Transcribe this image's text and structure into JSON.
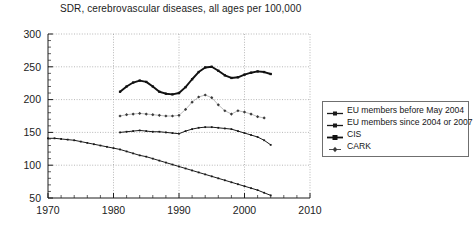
{
  "chart_data": {
    "type": "line",
    "title": "SDR, cerebrovascular diseases, all ages per 100,000",
    "xlabel": "",
    "ylabel": "",
    "xlim": [
      1970,
      2010
    ],
    "ylim": [
      50,
      300
    ],
    "xticks": [
      1970,
      1980,
      1990,
      2000,
      2010
    ],
    "yticks": [
      50,
      100,
      150,
      200,
      250,
      300
    ],
    "xminor_step": 2,
    "yminor_step": 10,
    "grid": true,
    "grid_style": "dotted",
    "legend_position": "right",
    "series": [
      {
        "name": "EU members before May 2004",
        "marker": "square",
        "color": "#1a1a1a",
        "x": [
          1970,
          1971,
          1972,
          1973,
          1974,
          1975,
          1976,
          1977,
          1978,
          1979,
          1980,
          1981,
          1982,
          1983,
          1984,
          1985,
          1986,
          1987,
          1988,
          1989,
          1990,
          1991,
          1992,
          1993,
          1994,
          1995,
          1996,
          1997,
          1998,
          1999,
          2000,
          2001,
          2002,
          2003,
          2004
        ],
        "values": [
          141,
          141,
          140,
          139,
          138,
          136,
          134,
          132,
          130,
          128,
          126,
          124,
          121,
          118,
          115,
          113,
          110,
          107,
          104,
          101,
          98,
          95,
          92,
          89,
          86,
          83,
          80,
          77,
          74,
          71,
          68,
          65,
          62,
          58,
          54
        ]
      },
      {
        "name": "EU members since 2004 or 2007",
        "marker": "square",
        "color": "#1a1a1a",
        "x": [
          1981,
          1982,
          1983,
          1984,
          1985,
          1986,
          1987,
          1988,
          1989,
          1990,
          1991,
          1992,
          1993,
          1994,
          1995,
          1996,
          1997,
          1998,
          1999,
          2000,
          2001,
          2002,
          2003,
          2004
        ],
        "values": [
          150,
          151,
          152,
          153,
          152,
          151,
          151,
          150,
          149,
          148,
          152,
          155,
          157,
          158,
          158,
          157,
          156,
          155,
          152,
          149,
          146,
          143,
          138,
          131
        ]
      },
      {
        "name": "CIS",
        "marker": "square",
        "color": "#111111",
        "x": [
          1981,
          1982,
          1983,
          1984,
          1985,
          1986,
          1987,
          1988,
          1989,
          1990,
          1991,
          1992,
          1993,
          1994,
          1995,
          1996,
          1997,
          1998,
          1999,
          2000,
          2001,
          2002,
          2003,
          2004
        ],
        "values": [
          212,
          220,
          226,
          229,
          227,
          220,
          212,
          209,
          208,
          210,
          219,
          231,
          242,
          249,
          250,
          244,
          237,
          233,
          234,
          238,
          241,
          243,
          242,
          239
        ]
      },
      {
        "name": "CARK",
        "marker": "diamond",
        "color": "#3a3a3a",
        "x": [
          1981,
          1982,
          1983,
          1984,
          1985,
          1986,
          1987,
          1988,
          1989,
          1990,
          1991,
          1992,
          1993,
          1994,
          1995,
          1996,
          1997,
          1998,
          1999,
          2000,
          2001,
          2002,
          2003
        ],
        "values": [
          175,
          177,
          178,
          179,
          178,
          177,
          176,
          175,
          175,
          176,
          185,
          196,
          204,
          207,
          203,
          192,
          183,
          178,
          183,
          181,
          178,
          174,
          172
        ]
      }
    ]
  },
  "axis": {
    "y_labels": [
      "300",
      "250",
      "200",
      "150",
      "100",
      "50"
    ],
    "x_labels": [
      "1970",
      "1980",
      "1990",
      "2000",
      "2010"
    ]
  },
  "legend": {
    "items": [
      {
        "label": "EU members before May 2004",
        "marker": "line-square-marker"
      },
      {
        "label": "EU members since 2004 or 2007",
        "marker": "line-square-marker"
      },
      {
        "label": "CIS",
        "marker": "line-square-marker"
      },
      {
        "label": "CARK",
        "marker": "line-diamond-marker"
      }
    ]
  }
}
